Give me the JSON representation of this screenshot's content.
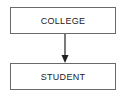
{
  "diagram": {
    "nodes": [
      {
        "id": "college",
        "label": "COLLEGE"
      },
      {
        "id": "student",
        "label": "STUDENT"
      }
    ],
    "edges": [
      {
        "from": "college",
        "to": "student",
        "type": "arrow"
      }
    ]
  }
}
